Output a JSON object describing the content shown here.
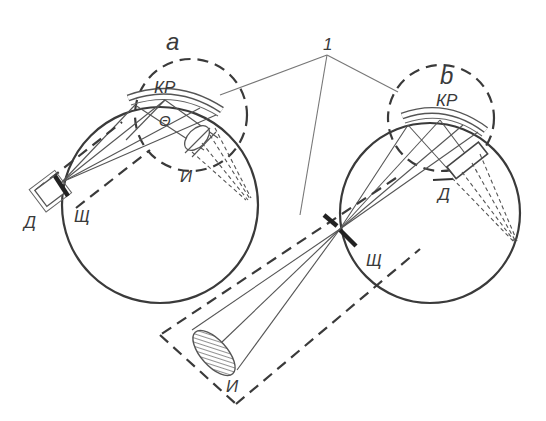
{
  "figure": {
    "type": "optical schematic: two eye cross-sections with contact lens (KP), slit, illuminator and detector",
    "colors": {
      "background": "#ffffff",
      "line": "#3a3a3a",
      "ray": "#555555",
      "leader": "#777777"
    }
  },
  "labels": {
    "panel_a": "a",
    "panel_b": "b",
    "callout_number": "1",
    "contact_lens_a": "КР",
    "contact_lens_b": "КР",
    "angle": "Θ",
    "illuminator_a": "И",
    "detector_a": "Д",
    "slit_a": "Щ",
    "detector_b": "Д",
    "slit_b": "Щ",
    "illuminator_b": "И"
  },
  "legend": {
    "КР": "contact lens",
    "И": "illuminator / source",
    "Д": "detector",
    "Щ": "slit",
    "Θ": "angle between illumination and detection axes",
    "1": "dashed module enclosures"
  }
}
